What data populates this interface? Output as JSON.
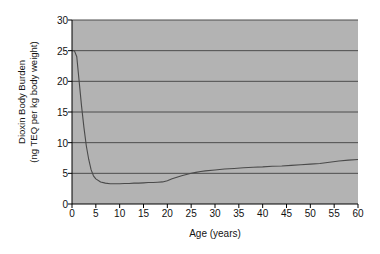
{
  "chart_data": {
    "type": "line",
    "title": "",
    "xlabel": "Age (years)",
    "ylabel": "Dioxin Body Burden (ng TEQ per kg body weight)",
    "ylabel_line1": "Dioxin Body Burden",
    "ylabel_line2": "(ng TEQ per kg body weight)",
    "xlim": [
      0,
      60
    ],
    "ylim": [
      0,
      30
    ],
    "xticks": [
      0,
      5,
      10,
      15,
      20,
      25,
      30,
      35,
      40,
      45,
      50,
      55,
      60
    ],
    "yticks": [
      0,
      5,
      10,
      15,
      20,
      25,
      30
    ],
    "grid": "horizontal",
    "legend": "none",
    "plot_background_color": "#b3b3b3",
    "grid_color": "#4d4d4d",
    "line_color": "#4a4a4a",
    "axis_color": "#000000",
    "series": [
      {
        "name": "Dioxin body burden",
        "x": [
          0,
          0.5,
          1,
          1.5,
          2,
          2.5,
          3,
          3.5,
          4,
          4.5,
          5,
          6,
          7,
          8,
          9,
          10,
          11,
          12,
          13,
          14,
          15,
          16,
          17,
          18,
          19,
          20,
          21,
          22,
          23,
          24,
          25,
          26,
          27,
          28,
          30,
          32,
          34,
          36,
          38,
          40,
          42,
          44,
          46,
          48,
          50,
          52,
          54,
          56,
          58,
          60
        ],
        "values": [
          25.0,
          25.0,
          24.0,
          20.0,
          16.0,
          12.5,
          9.5,
          7.3,
          5.6,
          4.6,
          4.1,
          3.6,
          3.4,
          3.3,
          3.3,
          3.3,
          3.35,
          3.35,
          3.4,
          3.4,
          3.45,
          3.5,
          3.5,
          3.55,
          3.6,
          3.8,
          4.1,
          4.35,
          4.6,
          4.8,
          5.0,
          5.15,
          5.3,
          5.4,
          5.55,
          5.7,
          5.8,
          5.9,
          6.0,
          6.05,
          6.15,
          6.2,
          6.3,
          6.4,
          6.5,
          6.6,
          6.8,
          7.0,
          7.15,
          7.25
        ]
      }
    ]
  }
}
